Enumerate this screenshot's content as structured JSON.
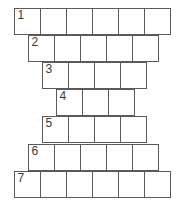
{
  "puzzle": {
    "title_remnant": "",
    "grid_type": "staircase-crossword",
    "cell_size_px": 27,
    "colors": {
      "cell_fill": "#ffffff",
      "cell_border": "#5a5a5a",
      "number_text": "#3a3a3a",
      "page_background": "#ffffff"
    },
    "rows": [
      {
        "number": "1",
        "cell_count": 6,
        "left_px": 14,
        "top_px": 8,
        "cells": [
          "",
          "",
          "",
          "",
          "",
          ""
        ]
      },
      {
        "number": "2",
        "cell_count": 5,
        "left_px": 28,
        "top_px": 35,
        "cells": [
          "",
          "",
          "",
          "",
          ""
        ]
      },
      {
        "number": "3",
        "cell_count": 4,
        "left_px": 42,
        "top_px": 62,
        "cells": [
          "",
          "",
          "",
          ""
        ]
      },
      {
        "number": "4",
        "cell_count": 3,
        "left_px": 56,
        "top_px": 89,
        "cells": [
          "",
          "",
          ""
        ]
      },
      {
        "number": "5",
        "cell_count": 4,
        "left_px": 42,
        "top_px": 116,
        "cells": [
          "",
          "",
          "",
          ""
        ]
      },
      {
        "number": "6",
        "cell_count": 5,
        "left_px": 28,
        "top_px": 144,
        "cells": [
          "",
          "",
          "",
          "",
          ""
        ]
      },
      {
        "number": "7",
        "cell_count": 6,
        "left_px": 14,
        "top_px": 171,
        "cells": [
          "",
          "",
          "",
          "",
          "",
          ""
        ]
      }
    ]
  }
}
